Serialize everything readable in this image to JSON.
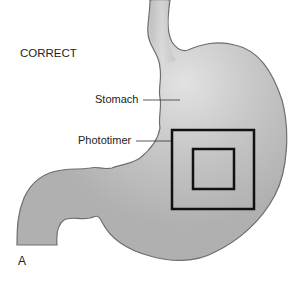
{
  "figure": {
    "title": "CORRECT",
    "panel_letter": "A",
    "labels": {
      "stomach": "Stomach",
      "phototimer": "Phototimer"
    },
    "colors": {
      "organ_fill": "#b3b3b3",
      "organ_highlight": "#dcdcdc",
      "outline": "#6e6e6e",
      "box": "#111111"
    }
  }
}
